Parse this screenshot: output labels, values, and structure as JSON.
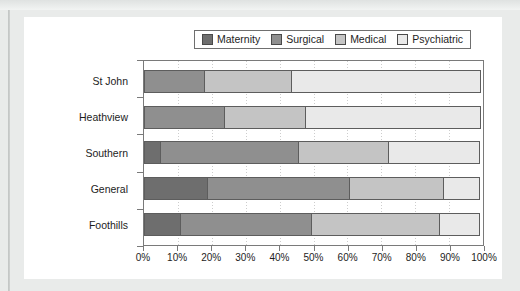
{
  "chart_data": {
    "type": "bar",
    "orientation": "horizontal",
    "stacked": true,
    "normalized_percent": true,
    "title": "",
    "subtitle": "",
    "xlabel": "",
    "ylabel": "",
    "xlim": [
      0,
      100
    ],
    "xtick_labels": [
      "0%",
      "10%",
      "20%",
      "30%",
      "40%",
      "50%",
      "60%",
      "70%",
      "80%",
      "90%",
      "100%"
    ],
    "xtick_values": [
      0,
      10,
      20,
      30,
      40,
      50,
      60,
      70,
      80,
      90,
      100
    ],
    "grid": "vertical-dotted",
    "legend_position": "top-center",
    "categories": [
      "St John",
      "Heathview",
      "Southern",
      "General",
      "Foothills"
    ],
    "series": [
      {
        "name": "Maternity",
        "color": "#6e6e6e",
        "values": [
          0,
          0,
          5,
          19,
          11
        ]
      },
      {
        "name": "Surgical",
        "color": "#8f8f8f",
        "values": [
          18,
          24,
          41,
          42,
          39
        ]
      },
      {
        "name": "Medical",
        "color": "#c4c4c4",
        "values": [
          26,
          24,
          27,
          28,
          38
        ]
      },
      {
        "name": "Psychiatric",
        "color": "#e9e9e9",
        "values": [
          56,
          52,
          27,
          11,
          12
        ]
      }
    ],
    "cumulative_boundaries": {
      "St John": [
        0,
        18,
        44,
        100
      ],
      "Heathview": [
        0,
        24,
        48,
        100
      ],
      "Southern": [
        5,
        46,
        73,
        100
      ],
      "General": [
        19,
        61,
        89,
        100
      ],
      "Foothills": [
        11,
        50,
        88,
        100
      ]
    }
  },
  "legend": {
    "items": [
      {
        "label": "Maternity",
        "color": "#6e6e6e"
      },
      {
        "label": "Surgical",
        "color": "#8f8f8f"
      },
      {
        "label": "Medical",
        "color": "#c4c4c4"
      },
      {
        "label": "Psychiatric",
        "color": "#e9e9e9"
      }
    ]
  },
  "colors": {
    "page_background": "#e9ebea",
    "card_background": "#ffffff",
    "axis": "#7a7a7a",
    "segment_border": "#5d5d5d",
    "gridline": "#cdcdcd",
    "text": "#1d1d1d"
  }
}
